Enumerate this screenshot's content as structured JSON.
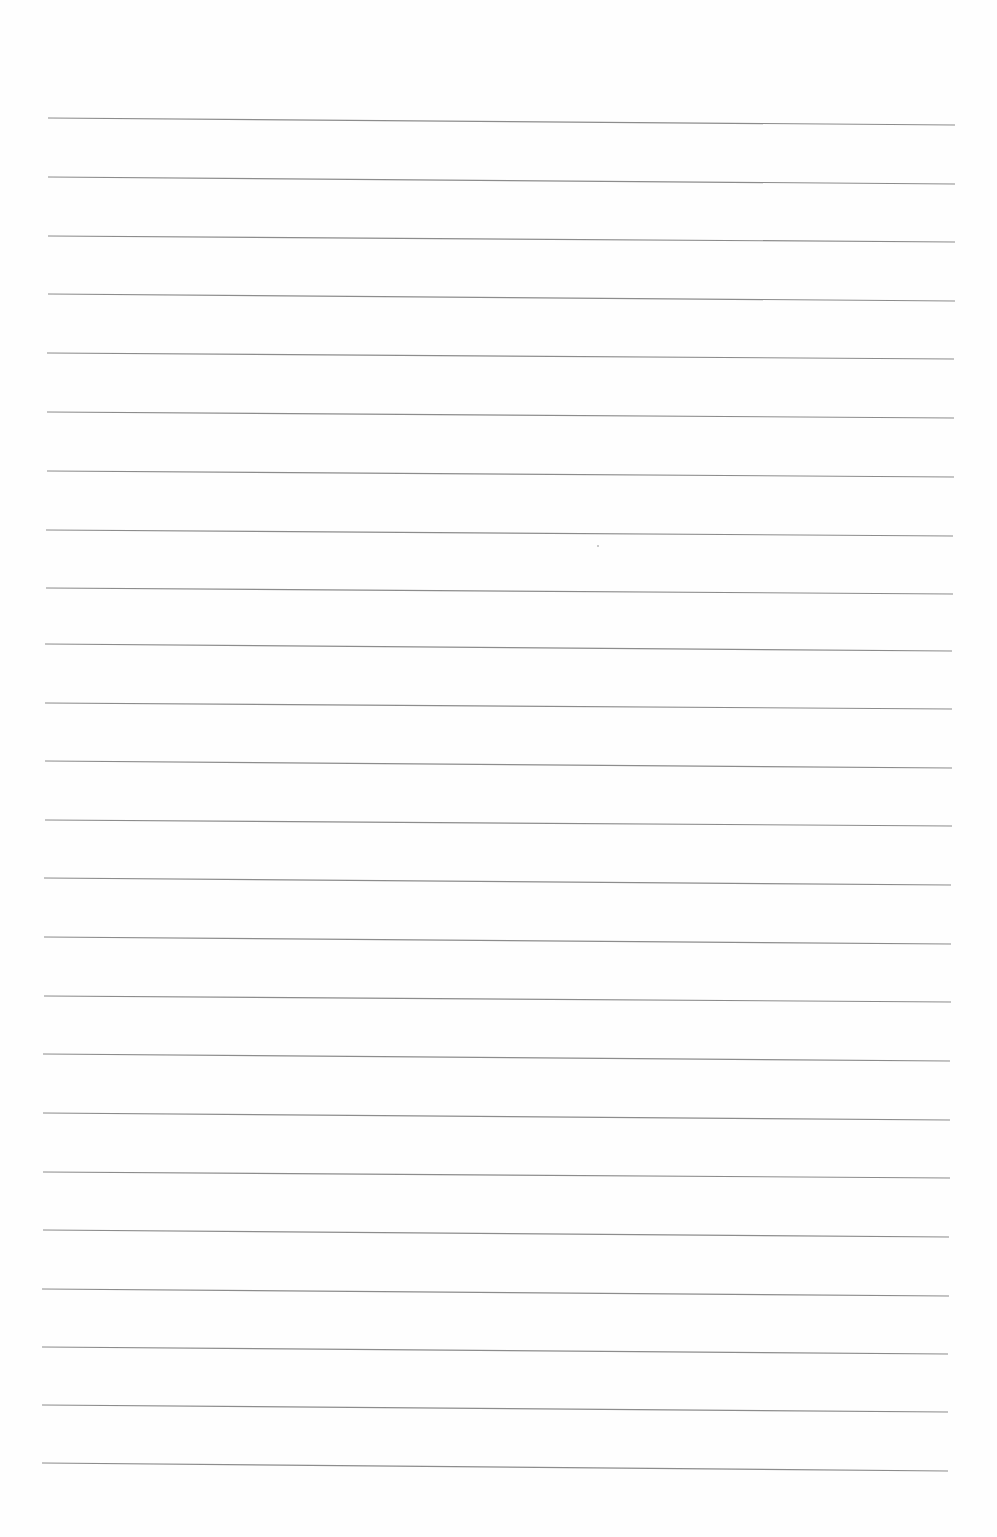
{
  "page": {
    "type": "blank ruled sheet",
    "background": "#fefefe",
    "line_color": "#8c8c8c",
    "line_width": 1.2,
    "line_count": 24,
    "lines": [
      {
        "x1": 48,
        "y1": 118,
        "x2": 955,
        "y2": 125
      },
      {
        "x1": 48,
        "y1": 177,
        "x2": 955,
        "y2": 184
      },
      {
        "x1": 48,
        "y1": 236,
        "x2": 955,
        "y2": 242
      },
      {
        "x1": 48,
        "y1": 294,
        "x2": 955,
        "y2": 301
      },
      {
        "x1": 47,
        "y1": 353,
        "x2": 954,
        "y2": 359
      },
      {
        "x1": 47,
        "y1": 412,
        "x2": 954,
        "y2": 418
      },
      {
        "x1": 47,
        "y1": 471,
        "x2": 954,
        "y2": 477
      },
      {
        "x1": 46,
        "y1": 530,
        "x2": 953,
        "y2": 536
      },
      {
        "x1": 46,
        "y1": 588,
        "x2": 953,
        "y2": 594
      },
      {
        "x1": 45,
        "y1": 644,
        "x2": 952,
        "y2": 651
      },
      {
        "x1": 45,
        "y1": 703,
        "x2": 952,
        "y2": 709
      },
      {
        "x1": 45,
        "y1": 761,
        "x2": 952,
        "y2": 768
      },
      {
        "x1": 45,
        "y1": 820,
        "x2": 952,
        "y2": 826
      },
      {
        "x1": 44,
        "y1": 878,
        "x2": 951,
        "y2": 885
      },
      {
        "x1": 44,
        "y1": 937,
        "x2": 951,
        "y2": 944
      },
      {
        "x1": 44,
        "y1": 996,
        "x2": 951,
        "y2": 1002
      },
      {
        "x1": 43,
        "y1": 1054,
        "x2": 950,
        "y2": 1061
      },
      {
        "x1": 43,
        "y1": 1113,
        "x2": 950,
        "y2": 1120
      },
      {
        "x1": 43,
        "y1": 1172,
        "x2": 950,
        "y2": 1178
      },
      {
        "x1": 43,
        "y1": 1230,
        "x2": 949,
        "y2": 1237
      },
      {
        "x1": 42,
        "y1": 1289,
        "x2": 949,
        "y2": 1296
      },
      {
        "x1": 42,
        "y1": 1347,
        "x2": 948,
        "y2": 1354
      },
      {
        "x1": 42,
        "y1": 1405,
        "x2": 948,
        "y2": 1412
      },
      {
        "x1": 42,
        "y1": 1463,
        "x2": 948,
        "y2": 1471
      }
    ],
    "specks": [
      {
        "x": 597,
        "y": 545
      }
    ]
  }
}
